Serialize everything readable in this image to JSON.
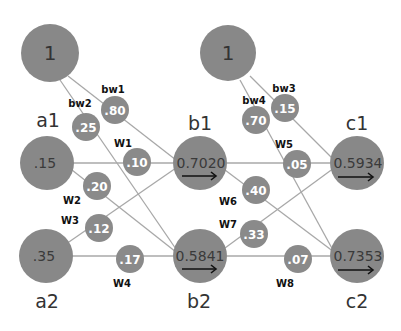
{
  "diagram": {
    "type": "neural-network",
    "colors": {
      "node": "#888888",
      "edge": "#a8a8a8",
      "weight_text": "#ffffff",
      "label": "#333333"
    },
    "bias_nodes": [
      {
        "id": "bias1",
        "value": "1"
      },
      {
        "id": "bias2",
        "value": "1"
      }
    ],
    "input_nodes": [
      {
        "id": "a1",
        "label": "a1",
        "value": ".15"
      },
      {
        "id": "a2",
        "label": "a2",
        "value": ".35"
      }
    ],
    "hidden_nodes": [
      {
        "id": "b1",
        "label": "b1",
        "value": "0.7020",
        "arrow": "→"
      },
      {
        "id": "b2",
        "label": "b2",
        "value": "0.5841",
        "arrow": "→"
      }
    ],
    "output_nodes": [
      {
        "id": "c1",
        "label": "c1",
        "value": "0.5934",
        "arrow": "→"
      },
      {
        "id": "c2",
        "label": "c2",
        "value": "0.7353",
        "arrow": "→"
      }
    ],
    "weights": [
      {
        "name": "bw1",
        "value": ".80",
        "from": "bias1",
        "to": "b1"
      },
      {
        "name": "bw2",
        "value": ".25",
        "from": "bias1",
        "to": "b2"
      },
      {
        "name": "W1",
        "value": ".10",
        "from": "a1",
        "to": "b1"
      },
      {
        "name": "W2",
        "value": ".20",
        "from": "a1",
        "to": "b2"
      },
      {
        "name": "W3",
        "value": ".12",
        "from": "a2",
        "to": "b1"
      },
      {
        "name": "W4",
        "value": ".17",
        "from": "a2",
        "to": "b2"
      },
      {
        "name": "bw3",
        "value": ".15",
        "from": "bias2",
        "to": "c1"
      },
      {
        "name": "bw4",
        "value": ".70",
        "from": "bias2",
        "to": "c2"
      },
      {
        "name": "W5",
        "value": ".05",
        "from": "b1",
        "to": "c1"
      },
      {
        "name": "W6",
        "value": ".40",
        "from": "b1",
        "to": "c2"
      },
      {
        "name": "W7",
        "value": ".33",
        "from": "b2",
        "to": "c1"
      },
      {
        "name": "W8",
        "value": ".07",
        "from": "b2",
        "to": "c2"
      }
    ]
  }
}
